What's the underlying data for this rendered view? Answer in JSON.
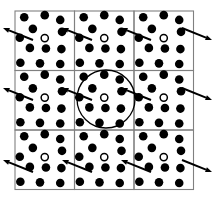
{
  "figure": {
    "type": "crystal-lattice-diagram",
    "canvas": {
      "width": 214,
      "height": 201
    },
    "colors": {
      "background": "#ffffff",
      "atom_fill": "#000000",
      "atom_open_fill": "#ffffff",
      "atom_open_stroke": "#000000",
      "grid_stroke": "#808080",
      "circle_stroke": "#000000",
      "arrow_stroke": "#000000"
    },
    "grid": {
      "rows": 3,
      "cols": 3,
      "origin_x": 15,
      "origin_y": 11,
      "cell_width": 59.5,
      "cell_height": 59.5,
      "line_width": 1.1,
      "cell_count": 9
    },
    "atoms": {
      "filled_radius": 4.3,
      "open_radius": 3.6,
      "open_inner_radius": 2.1,
      "per_cell_filled_count": 12,
      "per_cell_open_count": 1,
      "unit_cell_positions": [
        {
          "x": 0.155,
          "y": 0.105,
          "type": "filled"
        },
        {
          "x": 0.5,
          "y": 0.07,
          "type": "filled"
        },
        {
          "x": 0.76,
          "y": 0.15,
          "type": "filled"
        },
        {
          "x": 0.3,
          "y": 0.3,
          "type": "filled"
        },
        {
          "x": 0.79,
          "y": 0.35,
          "type": "filled"
        },
        {
          "x": 0.5,
          "y": 0.455,
          "type": "open"
        },
        {
          "x": 0.08,
          "y": 0.45,
          "type": "filled"
        },
        {
          "x": 0.25,
          "y": 0.62,
          "type": "filled"
        },
        {
          "x": 0.52,
          "y": 0.63,
          "type": "filled"
        },
        {
          "x": 0.78,
          "y": 0.64,
          "type": "filled"
        },
        {
          "x": 0.09,
          "y": 0.87,
          "type": "filled"
        },
        {
          "x": 0.42,
          "y": 0.88,
          "type": "filled"
        },
        {
          "x": 0.76,
          "y": 0.89,
          "type": "filled"
        }
      ]
    },
    "highlight_circle": {
      "label": "coordination-shell-circle",
      "center_x": 106,
      "center_y": 99,
      "radius": 29,
      "stroke_width": 1.3
    },
    "arrows": {
      "count": 12,
      "stroke_width": 1.9,
      "head_length": 6.5,
      "head_width": 5.0,
      "items": [
        {
          "id": "arrow-r1-left",
          "x1": 33,
          "y1": 40,
          "x2": 3,
          "y2": 28
        },
        {
          "id": "arrow-r1-mid",
          "x1": 92,
          "y1": 40,
          "x2": 62,
          "y2": 28
        },
        {
          "id": "arrow-r1-right",
          "x1": 151,
          "y1": 40,
          "x2": 121,
          "y2": 28
        },
        {
          "id": "arrow-r1-far",
          "x1": 182,
          "y1": 28,
          "x2": 212,
          "y2": 40
        },
        {
          "id": "arrow-r2-left",
          "x1": 33,
          "y1": 100,
          "x2": 3,
          "y2": 88
        },
        {
          "id": "arrow-r2-mid",
          "x1": 92,
          "y1": 100,
          "x2": 62,
          "y2": 88
        },
        {
          "id": "arrow-r2-right",
          "x1": 151,
          "y1": 100,
          "x2": 121,
          "y2": 88
        },
        {
          "id": "arrow-r2-far",
          "x1": 182,
          "y1": 88,
          "x2": 212,
          "y2": 100
        },
        {
          "id": "arrow-r3-left",
          "x1": 33,
          "y1": 172,
          "x2": 3,
          "y2": 160
        },
        {
          "id": "arrow-r3-mid",
          "x1": 92,
          "y1": 172,
          "x2": 62,
          "y2": 160
        },
        {
          "id": "arrow-r3-right",
          "x1": 151,
          "y1": 172,
          "x2": 121,
          "y2": 160
        },
        {
          "id": "arrow-r3-far",
          "x1": 182,
          "y1": 160,
          "x2": 212,
          "y2": 172
        }
      ]
    }
  }
}
